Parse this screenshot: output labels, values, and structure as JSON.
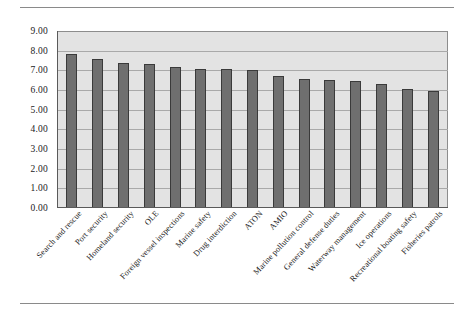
{
  "chart_data": {
    "type": "bar",
    "title": "",
    "subtitle": "",
    "xlabel": "",
    "ylabel": "",
    "ylim": [
      0,
      9
    ],
    "ytick_step": 1,
    "ytick_labels": [
      "9.00",
      "8.00",
      "7.00",
      "6.00",
      "5.00",
      "4.00",
      "3.00",
      "2.00",
      "1.00",
      "0.00"
    ],
    "ytick_values": [
      9,
      8,
      7,
      6,
      5,
      4,
      3,
      2,
      1,
      0
    ],
    "grid": true,
    "legend": null,
    "legend_position": "none",
    "orientation": "vertical",
    "categories": [
      "Search and rescue",
      "Port security",
      "Homeland security",
      "OLE",
      "Foreign vessel inspections",
      "Marine safety",
      "Drug interdiction",
      "ATON",
      "AMIO",
      "Marine pollution control",
      "General defense duties",
      "Waterway management",
      "Ice operations",
      "Recreational boating safety",
      "Fisheries patrols"
    ],
    "values": [
      7.82,
      7.58,
      7.36,
      7.3,
      7.18,
      7.08,
      7.06,
      7.03,
      6.71,
      6.55,
      6.52,
      6.46,
      6.3,
      6.06,
      5.95
    ],
    "series": [
      {
        "name": "",
        "values": [
          7.82,
          7.58,
          7.36,
          7.3,
          7.18,
          7.08,
          7.06,
          7.03,
          6.71,
          6.55,
          6.52,
          6.46,
          6.3,
          6.06,
          5.95
        ]
      }
    ],
    "colors": {
      "bar_fill": "#6f6f6f",
      "bar_stroke": "#3a3a3a",
      "plot_background": "#e3e3e3",
      "gridline": "#a9a9a9",
      "axis": "#5a5a5a",
      "text": "#1a1a1a",
      "rule": "#8a8a8a"
    }
  }
}
